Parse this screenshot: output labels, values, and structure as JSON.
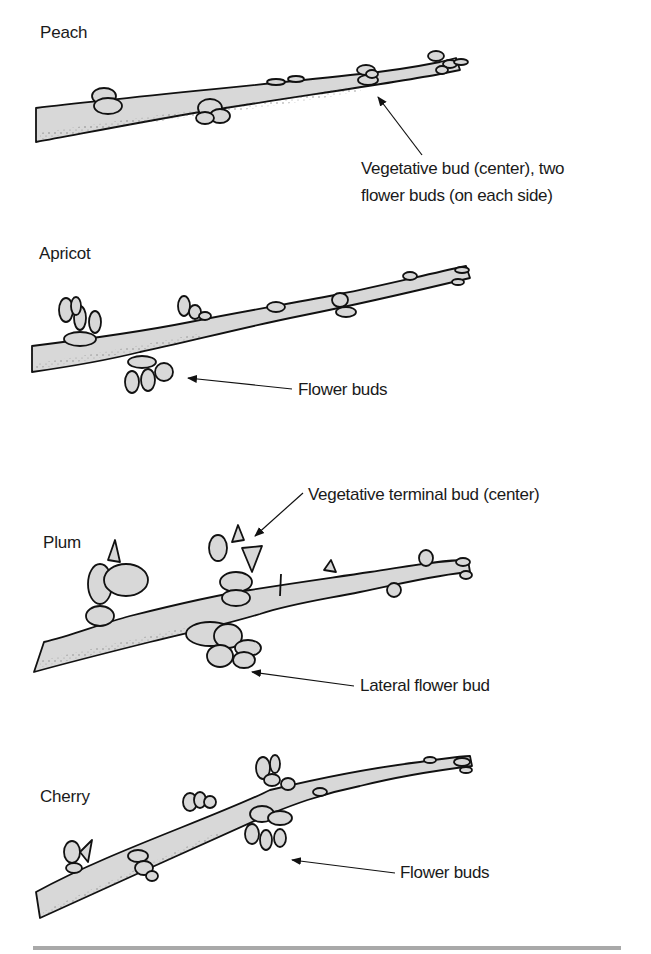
{
  "figure": {
    "colors": {
      "branch_fill": "#d8d8d8",
      "outline": "#111111",
      "rule": "#a9a9a9",
      "text": "#1a1a1a"
    },
    "panels": [
      {
        "name": "Peach",
        "annotations": [
          {
            "text_lines": [
              "Vegetative bud (center), two",
              "flower buds (on each side)"
            ],
            "points_to": "bud cluster near tip"
          }
        ]
      },
      {
        "name": "Apricot",
        "annotations": [
          {
            "text_lines": [
              "Flower buds"
            ],
            "points_to": "lower bud cluster"
          }
        ]
      },
      {
        "name": "Plum",
        "annotations": [
          {
            "text_lines": [
              "Vegetative terminal bud (center)"
            ],
            "points_to": "upper spur bud"
          },
          {
            "text_lines": [
              "Lateral flower bud"
            ],
            "points_to": "lower bud cluster"
          }
        ]
      },
      {
        "name": "Cherry",
        "annotations": [
          {
            "text_lines": [
              "Flower buds"
            ],
            "points_to": "spur bud cluster"
          }
        ]
      }
    ]
  }
}
